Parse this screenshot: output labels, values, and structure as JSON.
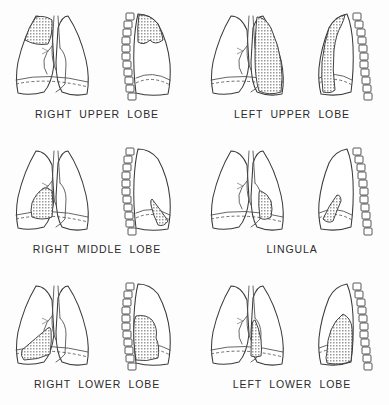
{
  "figure": {
    "background_color": "#fdfdfd",
    "ink_color": "#3a3a3a",
    "shade_color": "#9a9a9a",
    "shade_style": "fine grey cross-hatch stipple",
    "panel_count": 6,
    "rows": 3,
    "columns": 2
  },
  "panels": [
    {
      "id": "right-upper-lobe",
      "label": "RIGHT UPPER LOBE",
      "row": 0,
      "column": 0,
      "side": "right",
      "views": [
        "frontal",
        "lateral"
      ],
      "vertebrae_side": "left",
      "vertebrae_count": 11,
      "shaded_region_frontal": "upper zone of right lung, apex to minor fissure",
      "shaded_region_lateral": "anterosuperior wedge above the oblique fissure"
    },
    {
      "id": "left-upper-lobe",
      "label": "LEFT UPPER LOBE",
      "row": 0,
      "column": 1,
      "side": "left",
      "views": [
        "frontal",
        "lateral"
      ],
      "vertebrae_side": "right",
      "vertebrae_count": 11,
      "shaded_region_frontal": "entire left upper zone down to the oblique fissure",
      "shaded_region_lateral": "anterior band from apex to diaphragm"
    },
    {
      "id": "right-middle-lobe",
      "label": "RIGHT MIDDLE LOBE",
      "row": 1,
      "column": 0,
      "side": "right",
      "views": [
        "frontal",
        "lateral"
      ],
      "vertebrae_side": "left",
      "vertebrae_count": 11,
      "shaded_region_frontal": "lower medial zone adjacent to the right heart border",
      "shaded_region_lateral": "narrow anteroinferior triangle at the diaphragm"
    },
    {
      "id": "lingula",
      "label": "LINGULA",
      "row": 1,
      "column": 1,
      "side": "left",
      "views": [
        "frontal",
        "lateral"
      ],
      "vertebrae_side": "right",
      "vertebrae_count": 11,
      "shaded_region_frontal": "lower medial zone along the left heart border",
      "shaded_region_lateral": "small anteroinferior tongue above the diaphragm"
    },
    {
      "id": "right-lower-lobe",
      "label": "RIGHT LOWER LOBE",
      "row": 2,
      "column": 0,
      "side": "right",
      "views": [
        "frontal",
        "lateral"
      ],
      "vertebrae_side": "left",
      "vertebrae_count": 11,
      "shaded_region_frontal": "lateral costophrenic base of the right lung",
      "shaded_region_lateral": "posteroinferior block behind the oblique fissure"
    },
    {
      "id": "left-lower-lobe",
      "label": "LEFT LOWER LOBE",
      "row": 2,
      "column": 1,
      "side": "left",
      "views": [
        "frontal",
        "lateral"
      ],
      "vertebrae_side": "right",
      "vertebrae_count": 11,
      "shaded_region_frontal": "paracardiac base of the left lung",
      "shaded_region_lateral": "posteroinferior block behind the oblique fissure"
    }
  ]
}
